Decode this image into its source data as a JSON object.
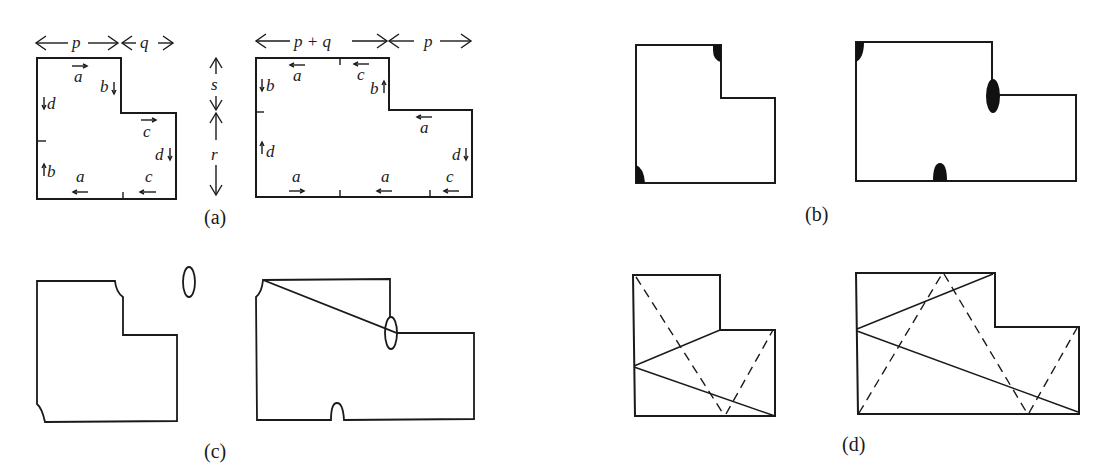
{
  "figure": {
    "panels": [
      {
        "id": "a",
        "caption": "(a)",
        "dimensions": {
          "p": "p",
          "q": "q",
          "p_plus_q": "p + q",
          "s": "s",
          "r": "r"
        },
        "left_shape_edge_labels": [
          "a",
          "b",
          "d",
          "c",
          "d",
          "b",
          "a",
          "c"
        ],
        "right_shape_edge_labels": [
          "a",
          "c",
          "b",
          "b",
          "a",
          "d",
          "d",
          "a",
          "a",
          "c"
        ]
      },
      {
        "id": "b",
        "caption": "(b)"
      },
      {
        "id": "c",
        "caption": "(c)"
      },
      {
        "id": "d",
        "caption": "(d)"
      }
    ]
  },
  "labels": {
    "a": "a",
    "b": "b",
    "c": "c",
    "d": "d",
    "p": "p",
    "q": "q",
    "pq": "p + q",
    "s": "s",
    "r": "r",
    "cap_a": "(a)",
    "cap_b": "(b)",
    "cap_c": "(c)",
    "cap_d": "(d)"
  }
}
